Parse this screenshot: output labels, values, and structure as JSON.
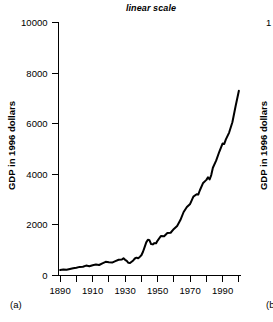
{
  "figure": {
    "panels": [
      {
        "panel_label": "(a)",
        "title": "linear scale",
        "ylabel": "GDP in 1996 dollars"
      },
      {
        "panel_label": "(b)",
        "ylabel": "GDP in 1996 dollars",
        "ytick_top_partial": "1"
      }
    ]
  },
  "chart_data": {
    "type": "line",
    "title": "linear scale",
    "xlabel": "",
    "ylabel": "GDP in 1996 dollars",
    "xlim": [
      1889,
      2001
    ],
    "ylim": [
      0,
      10000
    ],
    "yscale": "linear",
    "grid": false,
    "legend": null,
    "yticks": [
      0,
      2000,
      4000,
      6000,
      8000,
      10000
    ],
    "ytick_labels": [
      "0",
      "2000",
      "4000",
      "6000",
      "8000",
      "10000"
    ],
    "xticks": [
      1890,
      1910,
      1930,
      1950,
      1970,
      1990
    ],
    "xtick_labels": [
      "1890",
      "1910",
      "1930",
      "1950",
      "1970",
      "1990"
    ],
    "xminor_ticks": [
      1900,
      1920,
      1940,
      1960,
      1980,
      2000
    ],
    "line_color": "#000000",
    "line_width": 2.0,
    "series": [
      {
        "name": "GDP in 1996 dollars",
        "x": [
          1890,
          1892,
          1894,
          1896,
          1898,
          1900,
          1902,
          1904,
          1906,
          1908,
          1910,
          1912,
          1914,
          1916,
          1918,
          1920,
          1922,
          1924,
          1926,
          1928,
          1929,
          1930,
          1931,
          1932,
          1933,
          1934,
          1935,
          1936,
          1937,
          1938,
          1939,
          1940,
          1941,
          1942,
          1943,
          1944,
          1945,
          1946,
          1947,
          1948,
          1949,
          1950,
          1952,
          1954,
          1956,
          1958,
          1960,
          1962,
          1964,
          1966,
          1968,
          1970,
          1972,
          1974,
          1975,
          1976,
          1978,
          1980,
          1981,
          1982,
          1983,
          1984,
          1986,
          1988,
          1990,
          1991,
          1992,
          1994,
          1996,
          1998,
          2000
        ],
        "y": [
          215,
          240,
          228,
          258,
          285,
          310,
          340,
          345,
          392,
          368,
          408,
          432,
          415,
          482,
          540,
          520,
          512,
          568,
          622,
          632,
          680,
          620,
          578,
          502,
          492,
          545,
          595,
          672,
          706,
          680,
          735,
          800,
          940,
          1120,
          1310,
          1410,
          1390,
          1240,
          1230,
          1280,
          1270,
          1380,
          1560,
          1550,
          1680,
          1690,
          1840,
          1960,
          2190,
          2510,
          2710,
          2830,
          3120,
          3210,
          3200,
          3370,
          3660,
          3780,
          3880,
          3800,
          3970,
          4260,
          4540,
          4900,
          5220,
          5200,
          5380,
          5650,
          6060,
          6700,
          7300
        ]
      }
    ],
    "annotations": []
  }
}
